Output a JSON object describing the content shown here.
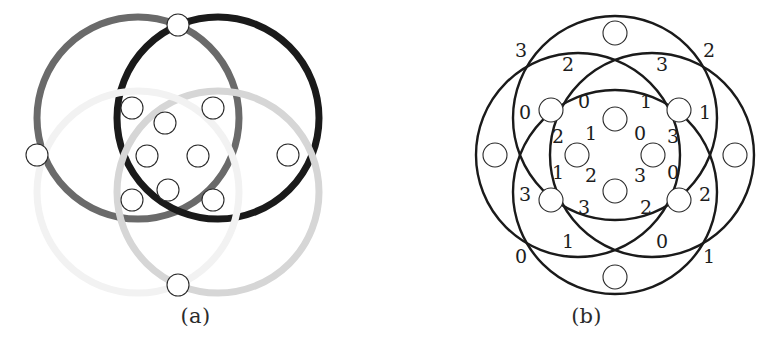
{
  "figure": {
    "width": 782,
    "height": 357,
    "background": "#ffffff",
    "panels": [
      {
        "id": "a",
        "caption": "(a)",
        "description": "Four overlapping circles drawn in four shades of gray with white-filled circular vertices at the intersection points",
        "vertex_count": 11,
        "circle_count": 4,
        "labels_shown": false
      },
      {
        "id": "b",
        "caption": "(b)",
        "description": "The same four-circle arrangement drawn uniformly in black with edge labels 0 to 3",
        "vertex_count": 12,
        "circle_count": 4,
        "labels_shown": true
      }
    ]
  },
  "colors": {
    "stroke_black": "#1a1a1a",
    "stroke_dark_gray": "#6a6a6a",
    "stroke_mid_gray": "#9a9a9a",
    "stroke_light_gray": "#d6d6d6",
    "stroke_faint_gray": "#f0f0f0",
    "vertex_fill": "#ffffff",
    "vertex_outline": "#2a2a2a",
    "label_color": "#1d1d1d",
    "background": "#ffffff"
  },
  "panel_a": {
    "caption": "(a)",
    "circles": [
      {
        "name": "circle-top-left",
        "cx": 138,
        "cy": 118,
        "r": 101,
        "color": "#6a6a6a",
        "width": 7
      },
      {
        "name": "circle-top-right",
        "cx": 218,
        "cy": 118,
        "r": 101,
        "color": "#1a1a1a",
        "width": 7
      },
      {
        "name": "circle-bottom-right",
        "cx": 218,
        "cy": 192,
        "r": 101,
        "color": "#d6d6d6",
        "width": 7
      },
      {
        "name": "circle-bottom-left",
        "cx": 138,
        "cy": 192,
        "r": 101,
        "color": "#f2f2f2",
        "width": 7
      }
    ],
    "vertices": [
      {
        "name": "vertex-top",
        "cx": 178,
        "cy": 25,
        "r": 11
      },
      {
        "name": "vertex-left",
        "cx": 37,
        "cy": 155,
        "r": 11
      },
      {
        "name": "vertex-right",
        "cx": 288,
        "cy": 155,
        "r": 11
      },
      {
        "name": "vertex-bottom",
        "cx": 178,
        "cy": 285,
        "r": 11
      },
      {
        "name": "vertex-inner-ul",
        "cx": 132,
        "cy": 108,
        "r": 11
      },
      {
        "name": "vertex-inner-ur",
        "cx": 213,
        "cy": 108,
        "r": 11
      },
      {
        "name": "vertex-inner-ll",
        "cx": 132,
        "cy": 200,
        "r": 11
      },
      {
        "name": "vertex-inner-lr",
        "cx": 213,
        "cy": 200,
        "r": 11
      },
      {
        "name": "vertex-core-top",
        "cx": 165,
        "cy": 123,
        "r": 11
      },
      {
        "name": "vertex-core-left",
        "cx": 147,
        "cy": 156,
        "r": 11
      },
      {
        "name": "vertex-core-right",
        "cx": 198,
        "cy": 156,
        "r": 11
      },
      {
        "name": "vertex-core-bottom",
        "cx": 168,
        "cy": 190,
        "r": 11
      }
    ]
  },
  "panel_b": {
    "caption": "(b)",
    "circles": [
      {
        "name": "circle-top",
        "cx": 224,
        "cy": 118,
        "r": 102,
        "color": "#1a1a1a",
        "width": 2.4
      },
      {
        "name": "circle-bottom",
        "cx": 224,
        "cy": 192,
        "r": 102,
        "color": "#1a1a1a",
        "width": 2.4
      },
      {
        "name": "circle-left",
        "cx": 187,
        "cy": 155,
        "r": 102,
        "color": "#1a1a1a",
        "width": 2.4
      },
      {
        "name": "circle-right",
        "cx": 261,
        "cy": 155,
        "r": 102,
        "color": "#1a1a1a",
        "width": 2.4
      }
    ],
    "vertices": [
      {
        "name": "vertex-outer-top",
        "cx": 224,
        "cy": 33,
        "r": 12
      },
      {
        "name": "vertex-outer-left",
        "cx": 104,
        "cy": 155,
        "r": 12
      },
      {
        "name": "vertex-outer-right",
        "cx": 344,
        "cy": 155,
        "r": 12
      },
      {
        "name": "vertex-outer-bottom",
        "cx": 224,
        "cy": 277,
        "r": 12
      },
      {
        "name": "vertex-ring-ul",
        "cx": 160,
        "cy": 110,
        "r": 12
      },
      {
        "name": "vertex-ring-ur",
        "cx": 288,
        "cy": 110,
        "r": 12
      },
      {
        "name": "vertex-ring-ll",
        "cx": 160,
        "cy": 200,
        "r": 12
      },
      {
        "name": "vertex-ring-lr",
        "cx": 288,
        "cy": 200,
        "r": 12
      },
      {
        "name": "vertex-inner-top",
        "cx": 224,
        "cy": 119,
        "r": 12
      },
      {
        "name": "vertex-inner-left",
        "cx": 186,
        "cy": 155,
        "r": 12
      },
      {
        "name": "vertex-inner-right",
        "cx": 262,
        "cy": 155,
        "r": 12
      },
      {
        "name": "vertex-inner-bottom",
        "cx": 224,
        "cy": 191,
        "r": 12
      }
    ],
    "edge_labels": [
      {
        "name": "label-outer-top-left",
        "text": "3",
        "x": 130,
        "y": 52
      },
      {
        "name": "label-outer-top-right",
        "text": "2",
        "x": 318,
        "y": 52
      },
      {
        "name": "label-outer-bottom-left",
        "text": "0",
        "x": 130,
        "y": 258
      },
      {
        "name": "label-outer-bottom-right",
        "text": "1",
        "x": 318,
        "y": 258
      },
      {
        "name": "label-upper-arc-left",
        "text": "2",
        "x": 177,
        "y": 66
      },
      {
        "name": "label-upper-arc-right",
        "text": "3",
        "x": 271,
        "y": 66
      },
      {
        "name": "label-lower-arc-left",
        "text": "1",
        "x": 177,
        "y": 243
      },
      {
        "name": "label-lower-arc-right",
        "text": "0",
        "x": 271,
        "y": 243
      },
      {
        "name": "label-left-arc-upper",
        "text": "0",
        "x": 134,
        "y": 114
      },
      {
        "name": "label-left-arc-lower",
        "text": "3",
        "x": 134,
        "y": 196
      },
      {
        "name": "label-right-arc-upper",
        "text": "1",
        "x": 314,
        "y": 114
      },
      {
        "name": "label-right-arc-lower",
        "text": "2",
        "x": 314,
        "y": 196
      },
      {
        "name": "label-ring-top-left",
        "text": "0",
        "x": 193,
        "y": 103
      },
      {
        "name": "label-ring-top-right",
        "text": "1",
        "x": 255,
        "y": 103
      },
      {
        "name": "label-ring-bottom-left",
        "text": "3",
        "x": 193,
        "y": 209
      },
      {
        "name": "label-ring-bottom-right",
        "text": "2",
        "x": 255,
        "y": 209
      },
      {
        "name": "label-inner-nw-outer",
        "text": "2",
        "x": 167,
        "y": 138
      },
      {
        "name": "label-inner-nw-inner",
        "text": "1",
        "x": 200,
        "y": 135
      },
      {
        "name": "label-inner-ne-inner",
        "text": "0",
        "x": 249,
        "y": 135
      },
      {
        "name": "label-inner-ne-outer",
        "text": "3",
        "x": 282,
        "y": 138
      },
      {
        "name": "label-inner-sw-outer",
        "text": "1",
        "x": 167,
        "y": 174
      },
      {
        "name": "label-inner-sw-inner",
        "text": "2",
        "x": 200,
        "y": 177
      },
      {
        "name": "label-inner-se-inner",
        "text": "3",
        "x": 249,
        "y": 177
      },
      {
        "name": "label-inner-se-outer",
        "text": "0",
        "x": 282,
        "y": 174
      }
    ]
  }
}
